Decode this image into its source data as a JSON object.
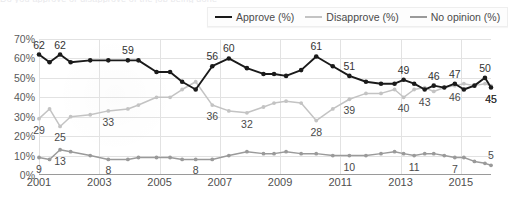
{
  "title_ghost": "Do you approve or disapprove of the job being done",
  "legend": {
    "position": "top-right",
    "items": [
      {
        "label": "Approve (%)",
        "color": "#1a1a1a",
        "key": "approve"
      },
      {
        "label": "Disapprove (%)",
        "color": "#c3c3c3",
        "key": "disapprove"
      },
      {
        "label": "No opinion (%)",
        "color": "#9a9a9a",
        "key": "no_opinion"
      }
    ]
  },
  "axes": {
    "y_ticks": [
      "0%",
      "10%",
      "20%",
      "30%",
      "40%",
      "50%",
      "60%",
      "70%"
    ],
    "x_ticks": [
      "2001",
      "2003",
      "2005",
      "2007",
      "2009",
      "2011",
      "2013",
      "2015"
    ]
  },
  "chart_data": {
    "type": "line",
    "title": "",
    "subtitle": "",
    "xlabel": "",
    "ylabel": "",
    "ylim": [
      0,
      70
    ],
    "ytick_step": 10,
    "xlim": [
      2001,
      2016
    ],
    "grid": true,
    "legend_position": "top-right",
    "x_tick_labels": [
      "2001",
      "2003",
      "2005",
      "2007",
      "2009",
      "2011",
      "2013",
      "2015"
    ],
    "x_tick_values": [
      2001,
      2003,
      2005,
      2007,
      2009,
      2011,
      2013,
      2015
    ],
    "series": [
      {
        "name": "Approve (%)",
        "color": "#1a1a1a",
        "x": [
          2001.0,
          2001.35,
          2001.7,
          2002.05,
          2002.7,
          2003.3,
          2003.95,
          2004.3,
          2004.9,
          2005.35,
          2005.75,
          2006.2,
          2006.75,
          2007.3,
          2007.9,
          2008.45,
          2008.8,
          2009.2,
          2009.7,
          2010.2,
          2010.75,
          2011.3,
          2011.85,
          2012.35,
          2012.8,
          2013.1,
          2013.45,
          2013.8,
          2014.1,
          2014.45,
          2014.8,
          2015.1,
          2015.45,
          2015.8,
          2016.0
        ],
        "y": [
          62,
          58,
          62,
          58,
          59,
          59,
          59,
          59,
          53,
          53,
          48,
          44,
          56,
          60,
          55,
          52,
          52,
          51,
          54,
          61,
          56,
          51,
          48,
          47,
          47,
          49,
          47,
          44,
          46,
          45,
          47,
          44,
          46,
          50,
          45
        ],
        "labels": [
          {
            "x": 2001.0,
            "y": 62,
            "text": "62",
            "pos": "above"
          },
          {
            "x": 2001.7,
            "y": 62,
            "text": "62",
            "pos": "above"
          },
          {
            "x": 2003.95,
            "y": 59,
            "text": "59",
            "pos": "above"
          },
          {
            "x": 2006.75,
            "y": 56,
            "text": "56",
            "pos": "above"
          },
          {
            "x": 2007.3,
            "y": 60,
            "text": "60",
            "pos": "above"
          },
          {
            "x": 2010.2,
            "y": 61,
            "text": "61",
            "pos": "above"
          },
          {
            "x": 2011.3,
            "y": 51,
            "text": "51",
            "pos": "above"
          },
          {
            "x": 2013.1,
            "y": 49,
            "text": "49",
            "pos": "above"
          },
          {
            "x": 2014.1,
            "y": 46,
            "text": "46",
            "pos": "above"
          },
          {
            "x": 2014.8,
            "y": 47,
            "text": "47",
            "pos": "above"
          },
          {
            "x": 2015.8,
            "y": 50,
            "text": "50",
            "pos": "above"
          },
          {
            "x": 2016.0,
            "y": 45,
            "text": "45",
            "pos": "below"
          }
        ]
      },
      {
        "name": "Disapprove (%)",
        "color": "#c3c3c3",
        "x": [
          2001.0,
          2001.35,
          2001.7,
          2002.05,
          2002.7,
          2003.3,
          2003.95,
          2004.3,
          2004.9,
          2005.35,
          2005.75,
          2006.2,
          2006.75,
          2007.3,
          2007.9,
          2008.45,
          2008.8,
          2009.2,
          2009.7,
          2010.2,
          2010.75,
          2011.3,
          2011.85,
          2012.35,
          2012.8,
          2013.1,
          2013.45,
          2013.8,
          2014.1,
          2014.45,
          2014.8,
          2015.1,
          2015.45,
          2015.8,
          2016.0
        ],
        "y": [
          29,
          34,
          25,
          30,
          31,
          33,
          34,
          36,
          40,
          40,
          44,
          48,
          36,
          33,
          32,
          35,
          37,
          38,
          37,
          28,
          34,
          39,
          42,
          42,
          44,
          40,
          44,
          45,
          43,
          45,
          46,
          47,
          46,
          47,
          46
        ],
        "labels": [
          {
            "x": 2001.0,
            "y": 29,
            "text": "29",
            "pos": "below"
          },
          {
            "x": 2001.7,
            "y": 25,
            "text": "25",
            "pos": "below"
          },
          {
            "x": 2003.3,
            "y": 33,
            "text": "33",
            "pos": "below"
          },
          {
            "x": 2006.75,
            "y": 36,
            "text": "36",
            "pos": "below"
          },
          {
            "x": 2007.9,
            "y": 32,
            "text": "32",
            "pos": "below"
          },
          {
            "x": 2010.2,
            "y": 28,
            "text": "28",
            "pos": "below"
          },
          {
            "x": 2011.3,
            "y": 39,
            "text": "39",
            "pos": "below"
          },
          {
            "x": 2013.1,
            "y": 40,
            "text": "40",
            "pos": "below"
          },
          {
            "x": 2013.8,
            "y": 43,
            "text": "43",
            "pos": "below"
          },
          {
            "x": 2014.8,
            "y": 46,
            "text": "46",
            "pos": "below"
          },
          {
            "x": 2016.0,
            "y": 45,
            "text": "45",
            "pos": "below"
          }
        ]
      },
      {
        "name": "No opinion (%)",
        "color": "#9a9a9a",
        "x": [
          2001.0,
          2001.35,
          2001.7,
          2002.05,
          2002.7,
          2003.3,
          2003.95,
          2004.3,
          2004.9,
          2005.35,
          2005.75,
          2006.2,
          2006.75,
          2007.3,
          2007.9,
          2008.45,
          2008.8,
          2009.2,
          2009.7,
          2010.2,
          2010.75,
          2011.3,
          2011.85,
          2012.35,
          2012.8,
          2013.1,
          2013.45,
          2013.8,
          2014.1,
          2014.45,
          2014.8,
          2015.1,
          2015.45,
          2015.8,
          2016.0
        ],
        "y": [
          9,
          8,
          13,
          12,
          10,
          8,
          8,
          9,
          9,
          9,
          8,
          8,
          8,
          10,
          12,
          11,
          11,
          12,
          11,
          11,
          10,
          10,
          10,
          11,
          12,
          11,
          10,
          11,
          11,
          10,
          9,
          9,
          7,
          6,
          5
        ],
        "labels": [
          {
            "x": 2001.0,
            "y": 9,
            "text": "9",
            "pos": "below"
          },
          {
            "x": 2001.7,
            "y": 13,
            "text": "13",
            "pos": "below"
          },
          {
            "x": 2003.3,
            "y": 8,
            "text": "8",
            "pos": "below"
          },
          {
            "x": 2006.2,
            "y": 8,
            "text": "8",
            "pos": "below"
          },
          {
            "x": 2011.3,
            "y": 10,
            "text": "10",
            "pos": "below"
          },
          {
            "x": 2013.45,
            "y": 10,
            "text": "11",
            "pos": "below"
          },
          {
            "x": 2014.8,
            "y": 9,
            "text": "7",
            "pos": "below"
          },
          {
            "x": 2016.0,
            "y": 5,
            "text": "5",
            "pos": "above"
          }
        ]
      }
    ]
  }
}
